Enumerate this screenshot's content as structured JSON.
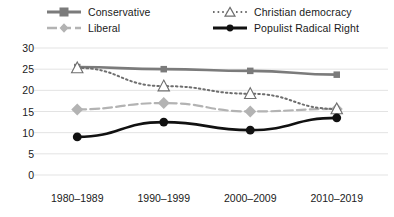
{
  "legend": {
    "position": "top",
    "entries": [
      {
        "label": "Conservative",
        "marker": "square-marker-icon",
        "line": "solid",
        "color": "#7b7b7b",
        "width": 2.6
      },
      {
        "label": "Liberal",
        "marker": "diamond-marker-icon",
        "line": "dashed",
        "color": "#b3b3b3",
        "width": 2.2
      },
      {
        "label": "Christian democracy",
        "marker": "triangle-marker-icon",
        "line": "dotted",
        "color": "#6e6e6e",
        "width": 2.0
      },
      {
        "label": "Populist Radical Right",
        "marker": "circle-marker-icon",
        "line": "solid",
        "color": "#111111",
        "width": 2.6
      }
    ]
  },
  "chart_data": {
    "type": "line",
    "title": "",
    "xlabel": "",
    "ylabel": "",
    "categories": [
      "1980–1989",
      "1990–1999",
      "2000–2009",
      "2010–2019"
    ],
    "ylim": [
      0,
      30
    ],
    "yticks": [
      0,
      5,
      10,
      15,
      20,
      25,
      30
    ],
    "ytick_labels": [
      "0",
      "5",
      "10",
      "15",
      "20",
      "25",
      "30"
    ],
    "grid": true,
    "grid_color": "#e3e3e3",
    "series": [
      {
        "name": "Conservative",
        "values": [
          25.5,
          25.0,
          24.6,
          23.7
        ],
        "color": "#7b7b7b",
        "line": "solid",
        "marker": "square",
        "width": 2.6,
        "marker_size": 6.5
      },
      {
        "name": "Liberal",
        "values": [
          15.5,
          17.0,
          15.0,
          15.6
        ],
        "color": "#b3b3b3",
        "line": "dashed",
        "marker": "diamond",
        "width": 2.2,
        "marker_size": 6.0
      },
      {
        "name": "Christian democracy",
        "values": [
          25.3,
          21.0,
          19.2,
          15.6
        ],
        "color": "#6e6e6e",
        "line": "dotted",
        "marker": "triangle",
        "width": 2.0,
        "marker_size": 6.0
      },
      {
        "name": "Populist Radical Right",
        "values": [
          9.0,
          12.5,
          10.6,
          13.5
        ],
        "color": "#111111",
        "line": "solid",
        "marker": "circle",
        "width": 2.6,
        "marker_size": 4.4
      }
    ]
  },
  "axes": {
    "y_tick_label_color": "#1a1a1a",
    "x_tick_label_color": "#1a1a1a"
  }
}
